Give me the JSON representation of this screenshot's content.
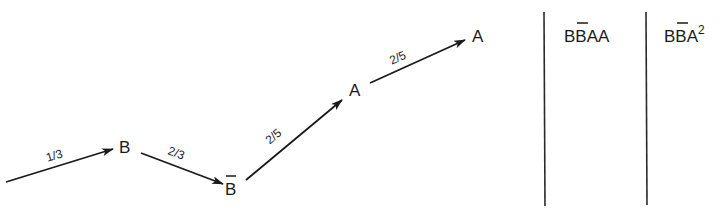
{
  "diagram": {
    "type": "path-diagram",
    "nodes": [
      {
        "id": "n1",
        "label": "B",
        "bar": false,
        "x": 125,
        "y": 146
      },
      {
        "id": "n2",
        "label": "B",
        "bar": true,
        "x": 231,
        "y": 187
      },
      {
        "id": "n3",
        "label": "A",
        "bar": false,
        "x": 355,
        "y": 90
      },
      {
        "id": "n4",
        "label": "A",
        "bar": false,
        "x": 478,
        "y": 35
      }
    ],
    "edges": [
      {
        "from": "start",
        "to": "n1",
        "label": "1/3"
      },
      {
        "from": "n1",
        "to": "n2",
        "label": "2/3"
      },
      {
        "from": "n2",
        "to": "n3",
        "label": "2/5"
      },
      {
        "from": "n3",
        "to": "n4",
        "label": "2/5"
      }
    ],
    "columns": [
      {
        "text_main": "BB",
        "text_bar_index": 1,
        "text_rest": "AA",
        "sup": "",
        "display": "BB̄AA"
      },
      {
        "text_main": "BB",
        "text_bar_index": 1,
        "text_rest": "A",
        "sup": "2",
        "display": "BB̄A²"
      }
    ]
  }
}
